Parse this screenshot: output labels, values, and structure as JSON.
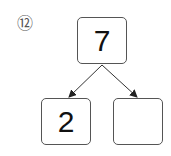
{
  "problem": {
    "number_label": "⑫",
    "top_value": "7",
    "bottom_left_value": "2",
    "bottom_right_value": ""
  }
}
